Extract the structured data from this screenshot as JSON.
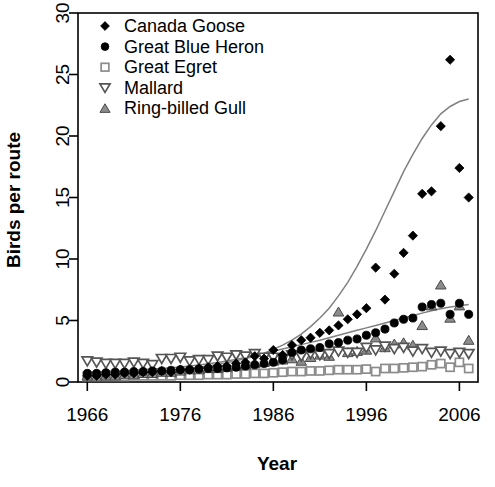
{
  "chart_data": {
    "type": "scatter",
    "title": "",
    "xlabel": "Year",
    "ylabel": "Birds per route",
    "xlim": [
      1965,
      2008
    ],
    "ylim": [
      0,
      30
    ],
    "xticks": [
      1966,
      1976,
      1986,
      1996,
      2006
    ],
    "yticks": [
      0,
      5,
      10,
      15,
      20,
      25,
      30
    ],
    "grid": false,
    "legend_position": "top-left",
    "x": [
      1966,
      1967,
      1968,
      1969,
      1970,
      1971,
      1972,
      1973,
      1974,
      1975,
      1976,
      1977,
      1978,
      1979,
      1980,
      1981,
      1982,
      1983,
      1984,
      1985,
      1986,
      1987,
      1988,
      1989,
      1990,
      1991,
      1992,
      1993,
      1994,
      1995,
      1996,
      1997,
      1998,
      1999,
      2000,
      2001,
      2002,
      2003,
      2004,
      2005,
      2006,
      2007
    ],
    "series": [
      {
        "name": "Canada Goose",
        "marker": "filled-diamond",
        "color": "#000000",
        "values": [
          0.5,
          0.5,
          0.6,
          0.6,
          0.7,
          0.7,
          0.8,
          0.8,
          0.9,
          0.8,
          1.0,
          1.0,
          1.1,
          1.2,
          1.3,
          1.3,
          1.5,
          1.6,
          2.1,
          1.9,
          2.6,
          2.2,
          3.0,
          3.4,
          3.6,
          4.0,
          4.2,
          4.6,
          5.1,
          5.5,
          6.0,
          9.3,
          6.7,
          8.8,
          10.5,
          11.9,
          15.3,
          15.5,
          20.8,
          26.2,
          17.4,
          15.0
        ],
        "trend": [
          0.6,
          0.62,
          0.65,
          0.68,
          0.72,
          0.76,
          0.8,
          0.85,
          0.9,
          0.96,
          1.02,
          1.1,
          1.2,
          1.3,
          1.42,
          1.56,
          1.72,
          1.9,
          2.1,
          2.35,
          2.65,
          3.0,
          3.4,
          3.9,
          4.5,
          5.2,
          6.0,
          7.0,
          8.1,
          9.4,
          10.8,
          12.3,
          13.9,
          15.5,
          17.1,
          18.5,
          19.8,
          20.9,
          21.8,
          22.4,
          22.8,
          23.0
        ]
      },
      {
        "name": "Great Blue Heron",
        "marker": "filled-circle",
        "color": "#000000",
        "values": [
          0.7,
          0.7,
          0.75,
          0.8,
          0.8,
          0.85,
          0.85,
          0.9,
          0.9,
          0.95,
          1.0,
          1.0,
          1.05,
          1.1,
          1.1,
          1.15,
          1.2,
          1.3,
          1.4,
          1.5,
          1.6,
          1.8,
          2.4,
          2.6,
          2.7,
          2.8,
          3.1,
          3.2,
          3.4,
          3.5,
          3.8,
          4.0,
          4.3,
          4.8,
          5.1,
          5.2,
          6.1,
          6.3,
          6.4,
          5.5,
          6.4,
          5.5
        ],
        "trend": [
          0.8,
          0.82,
          0.85,
          0.88,
          0.92,
          0.96,
          1.0,
          1.05,
          1.1,
          1.16,
          1.22,
          1.3,
          1.38,
          1.48,
          1.58,
          1.7,
          1.84,
          2.0,
          2.16,
          2.32,
          2.5,
          2.68,
          2.86,
          3.04,
          3.22,
          3.4,
          3.6,
          3.8,
          4.0,
          4.2,
          4.4,
          4.6,
          4.8,
          5.0,
          5.2,
          5.4,
          5.6,
          5.8,
          5.95,
          6.1,
          6.2,
          6.3
        ]
      },
      {
        "name": "Great Egret",
        "marker": "open-square",
        "color": "#8c8c8c",
        "values": [
          0.45,
          0.45,
          0.45,
          0.45,
          0.45,
          0.5,
          0.5,
          0.5,
          0.5,
          0.5,
          0.55,
          0.55,
          0.55,
          0.6,
          0.6,
          0.6,
          0.65,
          0.65,
          0.7,
          0.7,
          0.75,
          0.8,
          0.85,
          0.85,
          0.9,
          0.9,
          0.95,
          1.0,
          1.0,
          1.0,
          1.05,
          0.85,
          1.1,
          1.1,
          1.15,
          1.2,
          1.25,
          1.4,
          1.5,
          1.2,
          1.6,
          1.1
        ],
        "trend": null
      },
      {
        "name": "Mallard",
        "marker": "open-down-triangle",
        "color": "#555555",
        "values": [
          1.7,
          1.6,
          1.5,
          1.5,
          1.5,
          1.6,
          1.5,
          1.4,
          1.9,
          1.9,
          2.0,
          1.7,
          1.8,
          1.8,
          2.1,
          2.0,
          2.2,
          2.1,
          2.3,
          2.0,
          2.0,
          1.9,
          2.2,
          2.1,
          2.3,
          2.2,
          2.3,
          2.5,
          2.4,
          2.4,
          2.8,
          2.6,
          2.9,
          2.7,
          2.8,
          2.5,
          2.7,
          2.4,
          2.5,
          2.3,
          2.4,
          2.3
        ],
        "trend": null
      },
      {
        "name": "Ring-billed Gull",
        "marker": "filled-up-triangle",
        "color": "#8c8c8c",
        "values": [
          0.5,
          0.4,
          0.5,
          0.5,
          0.6,
          0.6,
          0.7,
          0.7,
          0.8,
          0.8,
          0.9,
          1.0,
          1.0,
          1.1,
          1.1,
          1.2,
          1.3,
          1.4,
          1.5,
          1.6,
          1.7,
          1.8,
          1.9,
          1.7,
          2.0,
          2.2,
          2.1,
          5.7,
          2.4,
          2.5,
          2.6,
          3.6,
          2.8,
          3.1,
          3.2,
          3.0,
          4.6,
          6.2,
          7.9,
          5.2,
          6.2,
          3.4
        ],
        "trend": null
      }
    ]
  },
  "legend": {
    "items": [
      {
        "label": "Canada Goose",
        "marker": "filled-diamond"
      },
      {
        "label": "Great Blue Heron",
        "marker": "filled-circle"
      },
      {
        "label": "Great Egret",
        "marker": "open-square"
      },
      {
        "label": "Mallard",
        "marker": "open-down-triangle"
      },
      {
        "label": "Ring-billed Gull",
        "marker": "filled-up-triangle"
      }
    ]
  },
  "axes": {
    "x_title": "Year",
    "y_title": "Birds per route",
    "x_tick_labels": [
      "1966",
      "1976",
      "1986",
      "1996",
      "2006"
    ],
    "y_tick_labels": [
      "0",
      "5",
      "10",
      "15",
      "20",
      "25",
      "30"
    ]
  },
  "colors": {
    "marker_black": "#000000",
    "marker_gray": "#8c8c8c",
    "trend_gray": "#808080",
    "axis_black": "#000000",
    "background": "#ffffff"
  }
}
